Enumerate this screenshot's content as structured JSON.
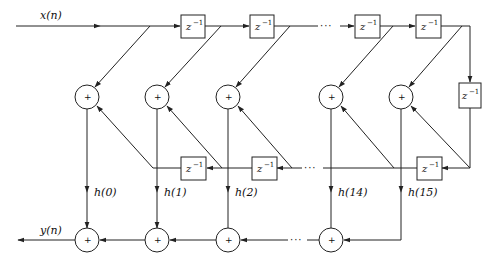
{
  "diagram": {
    "type": "FIR filter structure (linear phase, N=32, folded form)",
    "input_label": "x(n)",
    "output_label": "y(n)",
    "delay_label": "z",
    "delay_exp": "−1",
    "adder_symbol": "+",
    "ellipsis": "···",
    "coefficients": [
      "h(0)",
      "h(1)",
      "h(2)",
      "h(14)",
      "h(15)"
    ],
    "stroke_color": "#222222",
    "background": "#ffffff"
  }
}
